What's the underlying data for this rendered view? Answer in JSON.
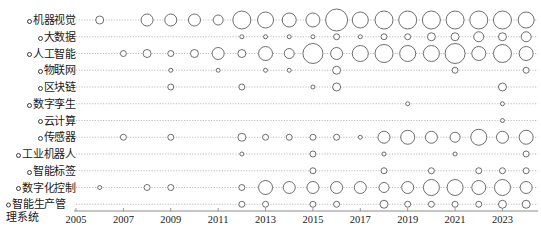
{
  "chart_data": {
    "type": "scatter",
    "title": "",
    "subtitle": "",
    "xlabel": "",
    "ylabel": "",
    "xlim": [
      2005,
      2024.5
    ],
    "x_ticks": [
      2005,
      2007,
      2009,
      2011,
      2013,
      2015,
      2017,
      2019,
      2021,
      2023
    ],
    "x_tick_labels": [
      "2005",
      "2007",
      "2009",
      "2011",
      "2013",
      "2015",
      "2017",
      "2019",
      "2021",
      "2023"
    ],
    "grid": true,
    "grid_style": "dotted-horizontal",
    "legend": "none",
    "bubble_color": "#ffffff",
    "bubble_edge_color": "#4a4a4a",
    "axis_color": "#9a9a9a",
    "categories": [
      "机器视觉",
      "大数据",
      "人工智能",
      "物联网",
      "区块链",
      "数字孪生",
      "云计算",
      "传感器",
      "工业机器人",
      "智能标签",
      "数字化控制",
      "智能生产管理系统"
    ],
    "series": [
      {
        "name": "机器视觉",
        "points": [
          {
            "x": 2006,
            "size": 4
          },
          {
            "x": 2008,
            "size": 6
          },
          {
            "x": 2009,
            "size": 6
          },
          {
            "x": 2010,
            "size": 6
          },
          {
            "x": 2011,
            "size": 5
          },
          {
            "x": 2012,
            "size": 9
          },
          {
            "x": 2013,
            "size": 8
          },
          {
            "x": 2014,
            "size": 7
          },
          {
            "x": 2015,
            "size": 7
          },
          {
            "x": 2016,
            "size": 11
          },
          {
            "x": 2017,
            "size": 8
          },
          {
            "x": 2018,
            "size": 9
          },
          {
            "x": 2019,
            "size": 9
          },
          {
            "x": 2020,
            "size": 9
          },
          {
            "x": 2021,
            "size": 9
          },
          {
            "x": 2022,
            "size": 9
          },
          {
            "x": 2023,
            "size": 9
          },
          {
            "x": 2024,
            "size": 8
          }
        ]
      },
      {
        "name": "大数据",
        "points": [
          {
            "x": 2012,
            "size": 2
          },
          {
            "x": 2013,
            "size": 2
          },
          {
            "x": 2014,
            "size": 2
          },
          {
            "x": 2015,
            "size": 2
          },
          {
            "x": 2016,
            "size": 3
          },
          {
            "x": 2017,
            "size": 2
          },
          {
            "x": 2018,
            "size": 3
          },
          {
            "x": 2019,
            "size": 3
          },
          {
            "x": 2020,
            "size": 4
          },
          {
            "x": 2021,
            "size": 4
          },
          {
            "x": 2022,
            "size": 5
          },
          {
            "x": 2023,
            "size": 4
          },
          {
            "x": 2024,
            "size": 5
          }
        ]
      },
      {
        "name": "人工智能",
        "points": [
          {
            "x": 2007,
            "size": 3
          },
          {
            "x": 2008,
            "size": 4
          },
          {
            "x": 2009,
            "size": 3
          },
          {
            "x": 2010,
            "size": 4
          },
          {
            "x": 2011,
            "size": 6
          },
          {
            "x": 2012,
            "size": 4
          },
          {
            "x": 2013,
            "size": 7
          },
          {
            "x": 2014,
            "size": 5
          },
          {
            "x": 2015,
            "size": 10
          },
          {
            "x": 2016,
            "size": 6
          },
          {
            "x": 2017,
            "size": 8
          },
          {
            "x": 2018,
            "size": 9
          },
          {
            "x": 2019,
            "size": 8
          },
          {
            "x": 2020,
            "size": 8
          },
          {
            "x": 2021,
            "size": 10
          },
          {
            "x": 2022,
            "size": 7
          },
          {
            "x": 2023,
            "size": 9
          },
          {
            "x": 2024,
            "size": 7
          }
        ]
      },
      {
        "name": "物联网",
        "points": [
          {
            "x": 2009,
            "size": 2
          },
          {
            "x": 2011,
            "size": 2
          },
          {
            "x": 2013,
            "size": 2
          },
          {
            "x": 2014,
            "size": 2
          },
          {
            "x": 2016,
            "size": 4
          },
          {
            "x": 2021,
            "size": 3
          },
          {
            "x": 2024,
            "size": 3
          }
        ]
      },
      {
        "name": "区块链",
        "points": [
          {
            "x": 2009,
            "size": 3
          },
          {
            "x": 2012,
            "size": 3
          },
          {
            "x": 2015,
            "size": 2
          },
          {
            "x": 2016,
            "size": 4
          },
          {
            "x": 2023,
            "size": 4
          }
        ]
      },
      {
        "name": "数字孪生",
        "points": [
          {
            "x": 2019,
            "size": 2
          },
          {
            "x": 2023,
            "size": 2
          }
        ]
      },
      {
        "name": "云计算",
        "points": [
          {
            "x": 2023,
            "size": 2
          }
        ]
      },
      {
        "name": "传感器",
        "points": [
          {
            "x": 2007,
            "size": 3
          },
          {
            "x": 2009,
            "size": 3
          },
          {
            "x": 2012,
            "size": 4
          },
          {
            "x": 2013,
            "size": 3
          },
          {
            "x": 2014,
            "size": 3
          },
          {
            "x": 2015,
            "size": 3
          },
          {
            "x": 2016,
            "size": 3
          },
          {
            "x": 2017,
            "size": 2
          },
          {
            "x": 2018,
            "size": 6
          },
          {
            "x": 2019,
            "size": 7
          },
          {
            "x": 2020,
            "size": 6
          },
          {
            "x": 2021,
            "size": 5
          },
          {
            "x": 2022,
            "size": 8
          },
          {
            "x": 2023,
            "size": 6
          },
          {
            "x": 2024,
            "size": 7
          }
        ]
      },
      {
        "name": "工业机器人",
        "points": [
          {
            "x": 2012,
            "size": 2
          },
          {
            "x": 2015,
            "size": 3
          },
          {
            "x": 2018,
            "size": 2
          },
          {
            "x": 2021,
            "size": 2
          },
          {
            "x": 2024,
            "size": 3
          }
        ]
      },
      {
        "name": "智能标签",
        "points": [
          {
            "x": 2015,
            "size": 3
          },
          {
            "x": 2018,
            "size": 3
          },
          {
            "x": 2020,
            "size": 3
          },
          {
            "x": 2022,
            "size": 3
          },
          {
            "x": 2023,
            "size": 3
          },
          {
            "x": 2024,
            "size": 3
          }
        ]
      },
      {
        "name": "数字化控制",
        "points": [
          {
            "x": 2006,
            "size": 2
          },
          {
            "x": 2008,
            "size": 3
          },
          {
            "x": 2009,
            "size": 3
          },
          {
            "x": 2012,
            "size": 3
          },
          {
            "x": 2013,
            "size": 7
          },
          {
            "x": 2014,
            "size": 6
          },
          {
            "x": 2015,
            "size": 6
          },
          {
            "x": 2016,
            "size": 6
          },
          {
            "x": 2017,
            "size": 6
          },
          {
            "x": 2018,
            "size": 5
          },
          {
            "x": 2019,
            "size": 6
          },
          {
            "x": 2020,
            "size": 8
          },
          {
            "x": 2021,
            "size": 8
          },
          {
            "x": 2022,
            "size": 7
          },
          {
            "x": 2023,
            "size": 8
          },
          {
            "x": 2024,
            "size": 6
          }
        ]
      },
      {
        "name": "智能生产管理系统",
        "points": [
          {
            "x": 2012,
            "size": 3
          },
          {
            "x": 2013,
            "size": 3
          },
          {
            "x": 2015,
            "size": 3
          },
          {
            "x": 2016,
            "size": 3
          },
          {
            "x": 2018,
            "size": 4
          },
          {
            "x": 2019,
            "size": 3
          },
          {
            "x": 2020,
            "size": 3
          },
          {
            "x": 2021,
            "size": 3
          },
          {
            "x": 2022,
            "size": 3
          },
          {
            "x": 2023,
            "size": 4
          },
          {
            "x": 2024,
            "size": 4
          }
        ]
      }
    ]
  },
  "axes": {
    "y_label_marker": "○",
    "caption": ""
  }
}
